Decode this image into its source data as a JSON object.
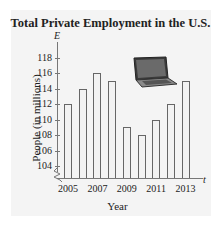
{
  "chart_data": {
    "type": "bar",
    "title": "Total Private Employment in the U.S.",
    "xlabel": "Year",
    "ylabel": "People (in millions)",
    "x_axis_variable": "t",
    "y_axis_variable": "E",
    "categories": [
      "2005",
      "2006",
      "2007",
      "2008",
      "2009",
      "2010",
      "2011",
      "2012",
      "2013"
    ],
    "values": [
      112,
      114,
      116,
      115,
      109,
      108,
      110,
      112,
      115
    ],
    "x_tick_labels": [
      "2005",
      "2007",
      "2009",
      "2011",
      "2013"
    ],
    "y_tick_labels": [
      "104",
      "106",
      "108",
      "110",
      "112",
      "114",
      "116",
      "118"
    ],
    "ylim": [
      103,
      119
    ],
    "axis_break": true,
    "grid": false,
    "legend": null
  },
  "labels": {
    "title": "Total Private Employment in the U.S.",
    "ylabel": "People (in millions)",
    "xlabel": "Year",
    "e": "E",
    "t": "t"
  },
  "decoration": {
    "image": "laptop-icon"
  }
}
